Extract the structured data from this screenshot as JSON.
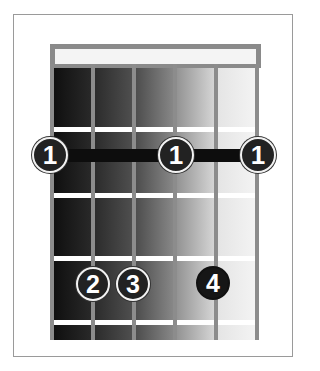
{
  "diagram": {
    "type": "chord-chart",
    "orientation": "vertical",
    "strings": 6,
    "frets_shown": 4,
    "lane_colors": [
      "#1a1a1a",
      "#3a3a3a",
      "#6a6a6a",
      "#b0b0b0",
      "#ececec"
    ],
    "barre": {
      "finger": "1",
      "fret": 1,
      "from_string": 1,
      "to_string": 6
    },
    "fingers": [
      {
        "label": "1",
        "string": 1,
        "fret": 1,
        "style": "white-ring"
      },
      {
        "label": "1",
        "string": 4,
        "fret": 1,
        "style": "white-ring"
      },
      {
        "label": "1",
        "string": 6,
        "fret": 1,
        "style": "white-ring"
      },
      {
        "label": "2",
        "string": 2,
        "fret": 3,
        "style": "white-ring"
      },
      {
        "label": "3",
        "string": 3,
        "fret": 3,
        "style": "white-ring"
      },
      {
        "label": "4",
        "string": 5,
        "fret": 3,
        "style": "dark-ring"
      }
    ]
  }
}
